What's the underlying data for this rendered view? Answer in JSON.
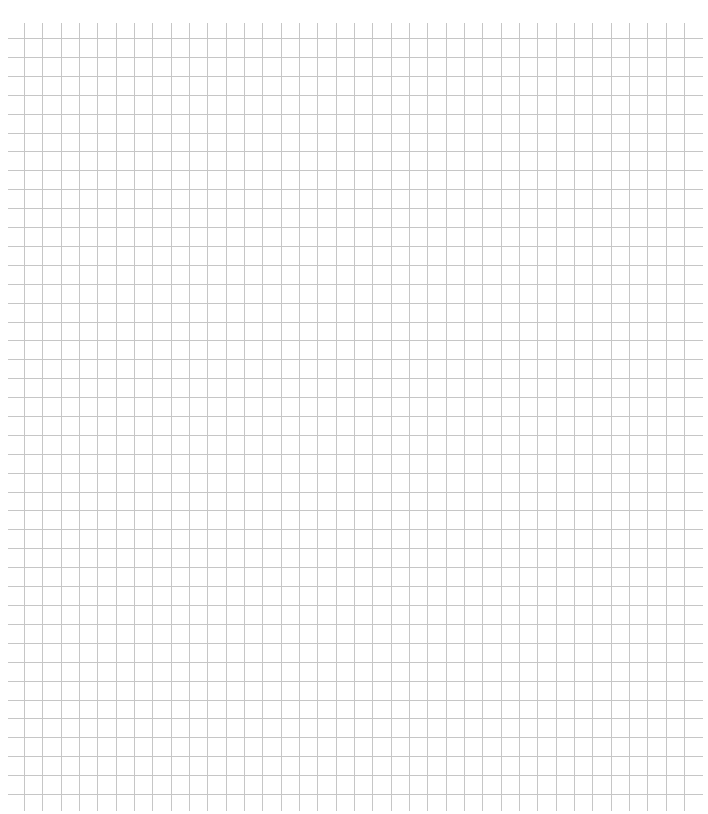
{
  "page": {
    "background": "#ffffff"
  },
  "grid": {
    "line_color": "#c6c6c6",
    "line_width": 1,
    "horizontal": {
      "count": 41,
      "y_start": 38,
      "y_end": 794,
      "x_start": 8,
      "x_end": 703
    },
    "vertical": {
      "count": 37,
      "x_start": 24,
      "x_end": 684,
      "y_start": 23,
      "y_end": 811
    }
  }
}
